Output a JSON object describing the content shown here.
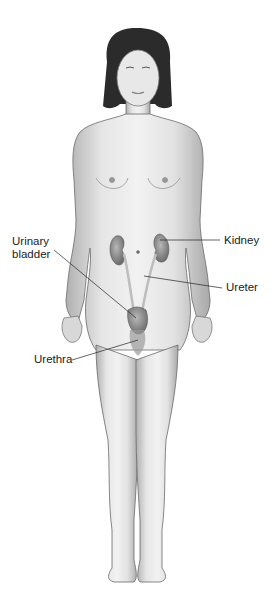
{
  "diagram": {
    "labels": {
      "urinary_bladder_line1": "Urinary",
      "urinary_bladder_line2": "bladder",
      "kidney": "Kidney",
      "ureter": "Ureter",
      "urethra": "Urethra"
    },
    "colors": {
      "skin_light": "#efefef",
      "skin_shadow": "#a8a8a8",
      "outline": "#6a6a6a",
      "hair": "#2a2a2a",
      "organ": "#8c8c8c",
      "leader_line": "#222222",
      "background": "#ffffff"
    }
  }
}
